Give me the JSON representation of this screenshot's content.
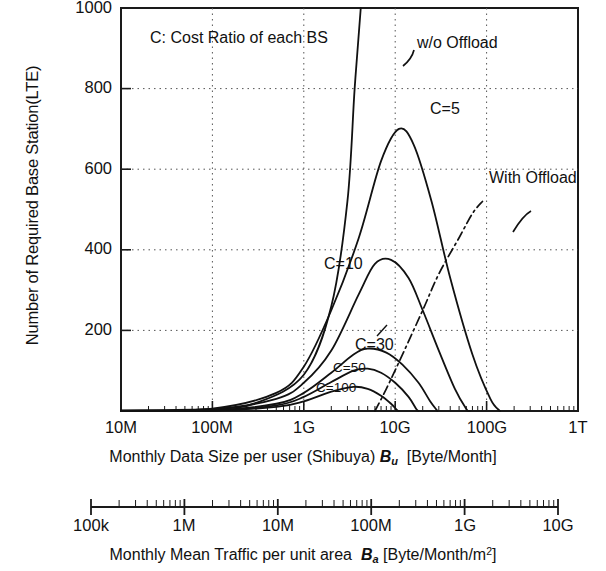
{
  "chart_data": {
    "type": "line",
    "title": "",
    "annotation_note": "C: Cost Ratio of each BS",
    "xlabel": "Monthly Data Size per user (Shibuya) Bu [Byte/Month]",
    "xlabel_main": "Monthly Data Size per user (Shibuya)",
    "xlabel_main_sym": "B",
    "xlabel_main_sub": "u",
    "xlabel_main_unit": "[Byte/Month]",
    "xlabel2": "Monthly Mean Traffic per unit area Ba [Byte/Month/m2]",
    "xlabel2_main": "Monthly Mean Traffic per unit area",
    "xlabel2_sym": "B",
    "xlabel2_sub": "a",
    "xlabel2_unit_pre": "[Byte/Month/m",
    "xlabel2_unit_sup": "2",
    "xlabel2_unit_post": "]",
    "ylabel": "Number of Required Base Station(LTE)",
    "xscale": "log",
    "yscale": "linear",
    "ylim": [
      0,
      1000
    ],
    "yticks": [
      1000,
      800,
      600,
      400,
      200
    ],
    "xticks": [
      "10M",
      "100M",
      "1G",
      "10G",
      "100G",
      "1T"
    ],
    "xticks2": [
      "100k",
      "1M",
      "10M",
      "100M",
      "1G",
      "10G"
    ],
    "grid": "dotted",
    "legend_position": "inline-annotations",
    "annotations": [
      {
        "label": "w/o Offload",
        "style": "solid"
      },
      {
        "label": "With Offload",
        "style": "dash-dot"
      },
      {
        "label": "C=5",
        "style": "solid"
      },
      {
        "label": "C=10",
        "style": "solid"
      },
      {
        "label": "C=30",
        "style": "solid"
      },
      {
        "label": "C=50",
        "style": "solid"
      },
      {
        "label": "C=100",
        "style": "solid"
      }
    ],
    "series": [
      {
        "name": "w/o Offload",
        "style": "solid",
        "description": "Steeply rising curve exceeding 1000 near Bu = 4G",
        "points": [
          [
            10000000.0,
            1
          ],
          [
            100000000.0,
            5
          ],
          [
            300000000.0,
            20
          ],
          [
            1000000000.0,
            90
          ],
          [
            2000000000.0,
            260
          ],
          [
            3000000000.0,
            520
          ],
          [
            3600000000.0,
            800
          ],
          [
            4200000000.0,
            1000
          ]
        ]
      },
      {
        "name": "C=5",
        "style": "solid",
        "description": "With-offload curve, peak about 700 near Bu = 10G",
        "points": [
          [
            10000000.0,
            1
          ],
          [
            100000000.0,
            6
          ],
          [
            500000000.0,
            45
          ],
          [
            1000000000.0,
            110
          ],
          [
            2000000000.0,
            250
          ],
          [
            4000000000.0,
            430
          ],
          [
            7000000000.0,
            620
          ],
          [
            11000000000.0,
            700
          ],
          [
            16000000000.0,
            660
          ],
          [
            25000000000.0,
            520
          ],
          [
            40000000000.0,
            330
          ],
          [
            70000000000.0,
            140
          ],
          [
            110000000000.0,
            30
          ],
          [
            140000000000.0,
            0
          ]
        ]
      },
      {
        "name": "C=10",
        "style": "solid",
        "description": "Peak about 375 near Bu = 6G",
        "points": [
          [
            10000000.0,
            1
          ],
          [
            100000000.0,
            4
          ],
          [
            500000000.0,
            30
          ],
          [
            1000000000.0,
            70
          ],
          [
            2000000000.0,
            150
          ],
          [
            4000000000.0,
            290
          ],
          [
            6000000000.0,
            365
          ],
          [
            9000000000.0,
            375
          ],
          [
            14000000000.0,
            330
          ],
          [
            20000000000.0,
            250
          ],
          [
            30000000000.0,
            150
          ],
          [
            45000000000.0,
            55
          ],
          [
            60000000000.0,
            5
          ],
          [
            65000000000.0,
            0
          ]
        ]
      },
      {
        "name": "C=30",
        "style": "solid",
        "description": "Peak about 155 near Bu = 5G",
        "points": [
          [
            10000000.0,
            0
          ],
          [
            100000000.0,
            2
          ],
          [
            500000000.0,
            18
          ],
          [
            1000000000.0,
            45
          ],
          [
            2000000000.0,
            95
          ],
          [
            3500000000.0,
            140
          ],
          [
            5000000000.0,
            155
          ],
          [
            8000000000.0,
            145
          ],
          [
            12000000000.0,
            115
          ],
          [
            18000000000.0,
            70
          ],
          [
            24000000000.0,
            25
          ],
          [
            29000000000.0,
            0
          ]
        ]
      },
      {
        "name": "C=50",
        "style": "solid",
        "description": "Peak about 105 near Bu = 4G",
        "points": [
          [
            10000000.0,
            0
          ],
          [
            100000000.0,
            1
          ],
          [
            500000000.0,
            14
          ],
          [
            1000000000.0,
            35
          ],
          [
            2000000000.0,
            72
          ],
          [
            3500000000.0,
            100
          ],
          [
            5000000000.0,
            105
          ],
          [
            7000000000.0,
            95
          ],
          [
            10000000000.0,
            70
          ],
          [
            14000000000.0,
            35
          ],
          [
            17000000000.0,
            5
          ],
          [
            18000000000.0,
            0
          ]
        ]
      },
      {
        "name": "C=100",
        "style": "solid",
        "description": "Peak about 60 near Bu = 3.5G",
        "points": [
          [
            10000000.0,
            0
          ],
          [
            100000000.0,
            1
          ],
          [
            500000000.0,
            10
          ],
          [
            1000000000.0,
            24
          ],
          [
            2000000000.0,
            48
          ],
          [
            3500000000.0,
            60
          ],
          [
            5000000000.0,
            55
          ],
          [
            7000000000.0,
            38
          ],
          [
            9000000000.0,
            18
          ],
          [
            10500000000.0,
            2
          ],
          [
            11000000000.0,
            0
          ]
        ]
      },
      {
        "name": "With Offload",
        "style": "dash-dot",
        "description": "Diagonal dash-dot boundary line rising from lower-left to upper-right",
        "points": [
          [
            6000000000.0,
            0
          ],
          [
            8000000000.0,
            55
          ],
          [
            12000000000.0,
            140
          ],
          [
            20000000000.0,
            250
          ],
          [
            30000000000.0,
            340
          ],
          [
            50000000000.0,
            430
          ],
          [
            70000000000.0,
            490
          ],
          [
            90000000000.0,
            520
          ]
        ]
      }
    ]
  }
}
